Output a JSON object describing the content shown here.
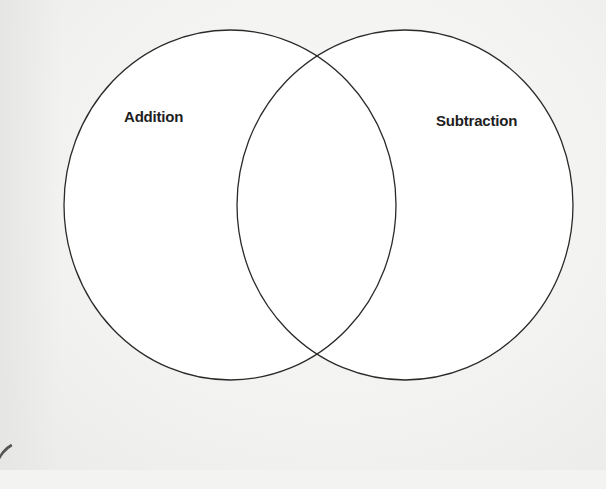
{
  "diagram": {
    "type": "venn",
    "sets": [
      {
        "label": "Addition",
        "cx": 230,
        "cy": 205,
        "rx": 166,
        "ry": 175
      },
      {
        "label": "Subtraction",
        "cx": 405,
        "cy": 205,
        "rx": 168,
        "ry": 175
      }
    ],
    "colors": {
      "stroke": "#2a2a2a",
      "fill": "#ffffff",
      "page": "#f3f3f2",
      "label": "#1e1e1e"
    }
  }
}
